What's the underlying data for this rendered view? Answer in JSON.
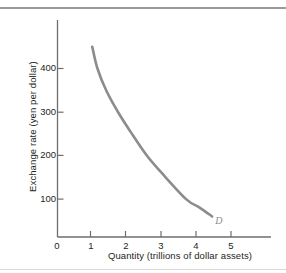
{
  "chart_data": {
    "type": "line",
    "title": "",
    "subtitle": "",
    "xlabel": "Quantity (trillions of dollar assets)",
    "ylabel": "Exchange rate (yen per dollar)",
    "xlim": [
      0,
      5.9
    ],
    "ylim": [
      0,
      500
    ],
    "xticks": [
      0,
      1,
      2,
      3,
      4,
      5
    ],
    "xtick_labels": [
      "0",
      "1",
      "2",
      "3",
      "4",
      "5"
    ],
    "yticks": [
      100,
      200,
      300,
      400
    ],
    "ytick_labels": [
      "100",
      "200",
      "300",
      "400"
    ],
    "grid": false,
    "legend": "none",
    "series": [
      {
        "name": "D",
        "annotation": "D",
        "color": "#8c8c8c",
        "linewidth": 2.6,
        "x": [
          1.0,
          1.15,
          1.4,
          1.74,
          2.1,
          2.57,
          3.0,
          3.7,
          4.1,
          4.45
        ],
        "y": [
          450,
          400,
          350,
          300,
          255,
          200,
          160,
          100,
          80,
          60
        ]
      }
    ],
    "annotations": [
      {
        "text": "D",
        "x": 4.6,
        "y": 48
      }
    ],
    "colors": {
      "curve": "#8c8c8c",
      "axis": "#6e6e6e",
      "text": "#231f20",
      "rule": "#9a9a9a",
      "background": "#ffffff"
    }
  }
}
